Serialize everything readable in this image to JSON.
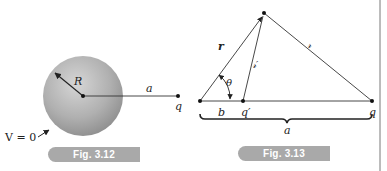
{
  "figures": [
    {
      "caption": "Fig. 3.12",
      "labels": {
        "radius": "R",
        "distance": "a",
        "charge": "q",
        "potential": "V = 0"
      }
    },
    {
      "caption": "Fig. 3.13",
      "labels": {
        "position_vector": "r",
        "separation_to_q": "𝓇",
        "separation_to_image": "𝓇′",
        "angle": "θ",
        "image_distance": "b",
        "image_charge": "q′",
        "charge": "q",
        "total_distance": "a"
      }
    }
  ],
  "colors": {
    "sphere_light": "#d4d4d4",
    "sphere_dark": "#8f8f8f",
    "line": "#333333",
    "caption_bg": "#a9a9a9",
    "caption_text": "#ffffff"
  }
}
